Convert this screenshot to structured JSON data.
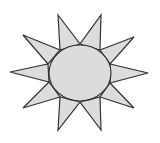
{
  "figure": {
    "width": 160,
    "height": 143,
    "background": "#ffffff",
    "fill_color": "#dcdcdc",
    "stroke_color": "#333333",
    "stroke_width": 1.2,
    "center": {
      "cx": 80,
      "cy": 73,
      "rx": 31,
      "ry": 28
    },
    "ray_count": 10,
    "rays": [
      {
        "name": "ray-top-left",
        "points": "58,15 80,44 60,50"
      },
      {
        "name": "ray-top-right",
        "points": "101,15 100,50 80,44"
      },
      {
        "name": "ray-upper-right",
        "points": "134,37 110,64 100,50"
      },
      {
        "name": "ray-right",
        "points": "148,73 110,83 110,64"
      },
      {
        "name": "ray-lower-right",
        "points": "134,108 100,97 110,83"
      },
      {
        "name": "ray-bottom-right",
        "points": "101,130 80,102 100,97"
      },
      {
        "name": "ray-bottom-left",
        "points": "58,130 60,97 80,102"
      },
      {
        "name": "ray-lower-left",
        "points": "23,108 49,82 60,97"
      },
      {
        "name": "ray-left",
        "points": "10,72 48,64 49,82"
      },
      {
        "name": "ray-upper-left",
        "points": "23,35 60,50 48,64"
      }
    ]
  }
}
